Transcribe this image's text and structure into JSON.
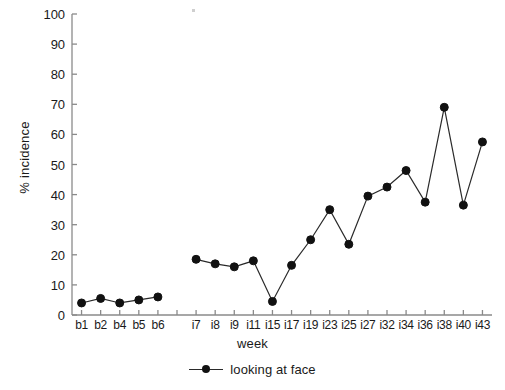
{
  "chart_data": {
    "type": "line",
    "title": "",
    "xlabel": "week",
    "ylabel": "% incidence",
    "ylim": [
      0,
      100
    ],
    "ytick_step": 10,
    "yticks": [
      0,
      10,
      20,
      30,
      40,
      50,
      60,
      70,
      80,
      90,
      100
    ],
    "grid": false,
    "legend_position": "bottom-center",
    "marker": "filled-circle",
    "line_color": "#2a2a2a",
    "marker_color": "#111111",
    "axis_color": "#8a8a8a",
    "categories": [
      "b1",
      "b2",
      "b4",
      "b5",
      "b6",
      "",
      "i7",
      "i8",
      "i9",
      "i11",
      "i15",
      "i17",
      "i19",
      "i23",
      "i25",
      "i27",
      "i32",
      "i34",
      "i36",
      "i38",
      "i40",
      "i43"
    ],
    "series": [
      {
        "name": "looking at face",
        "values": [
          4,
          5.5,
          4,
          5,
          6,
          null,
          18.5,
          17,
          16,
          18,
          4.5,
          16.5,
          25,
          35,
          23.5,
          39.5,
          42.5,
          48,
          37.5,
          69,
          36.5,
          57.5
        ]
      }
    ]
  },
  "legend": {
    "entries": [
      {
        "label": "looking at face",
        "icon": "line-marker-icon"
      }
    ]
  },
  "axes": {
    "y_title": "% incidence",
    "x_title": "week"
  }
}
